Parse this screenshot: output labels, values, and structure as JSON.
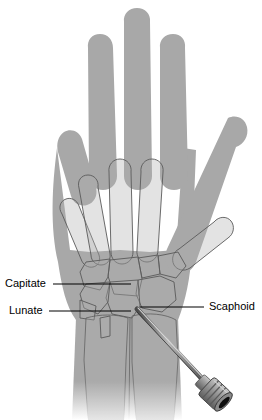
{
  "figure": {
    "view": "dorsal (posteroanterior) radiographic-style illustration",
    "background_color": "#ffffff"
  },
  "colors": {
    "soft_tissue_fill": "#a8a8a8",
    "soft_tissue_fill_light": "#b4b4b4",
    "bone_fill": "#b0b0b0",
    "bone_outline": "#5a5a5a",
    "leader_line": "#000000",
    "label_text": "#000000",
    "instrument_body": "#8f8f8f",
    "instrument_dark": "#3a3a3a",
    "instrument_bore": "#0d0d0d",
    "instrument_highlight": "#d2d2d2",
    "wire_shaft": "#6e6e6e"
  },
  "labels": [
    {
      "id": "capitate",
      "text": "Capitate",
      "text_anchor": "start",
      "text_x": 5,
      "text_y": 284,
      "leader_from": [
        53,
        284
      ],
      "leader_to": [
        131,
        284
      ],
      "side": "left"
    },
    {
      "id": "lunate",
      "text": "Lunate",
      "text_anchor": "start",
      "text_x": 9,
      "text_y": 311,
      "leader_from": [
        49,
        311
      ],
      "leader_to": [
        131,
        311
      ],
      "side": "left"
    },
    {
      "id": "scaphoid",
      "text": "Scaphoid",
      "text_anchor": "start",
      "text_x": 209,
      "text_y": 307,
      "leader_from": [
        204,
        307
      ],
      "leader_to": [
        140,
        307
      ],
      "side": "right"
    }
  ],
  "anatomy": {
    "digits": [
      {
        "name": "little-finger",
        "position": "far-left"
      },
      {
        "name": "ring-finger",
        "position": "left"
      },
      {
        "name": "middle-finger",
        "position": "center"
      },
      {
        "name": "index-finger",
        "position": "right"
      },
      {
        "name": "thumb",
        "position": "far-right"
      }
    ],
    "regions": [
      {
        "name": "phalanges",
        "description": "four extended fingers as gray silhouettes"
      },
      {
        "name": "metacarpals",
        "description": "five outlined metacarpal shafts fanning from the carpus"
      },
      {
        "name": "carpal-bones",
        "description": "proximal and distal carpal rows as outlined mosaic"
      },
      {
        "name": "distal-radius",
        "description": "forearm bone, radial side"
      },
      {
        "name": "distal-ulna",
        "description": "forearm bone, ulnar side"
      },
      {
        "name": "forearm",
        "description": "soft tissue column fading toward the lower edge"
      }
    ]
  },
  "instrument": {
    "name": "cannulated guide wire with driver hub",
    "wire_entry_point": [
      137,
      309
    ],
    "wire_exit_point": [
      206,
      383
    ],
    "hub_center": [
      215,
      394
    ],
    "hub_description": "ridged cylindrical chuck with central dark bore"
  }
}
